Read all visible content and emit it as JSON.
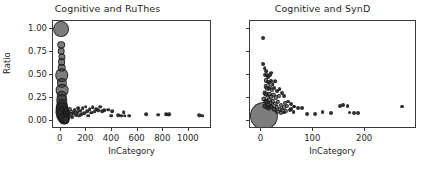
{
  "figure": {
    "width": 430,
    "height": 173,
    "background": "#ffffff",
    "marker_color": "#2d2d2d",
    "axis_color": "#3a3a3a",
    "text_color": "#262626"
  },
  "shared": {
    "ylabel": "Ratio",
    "xlabel": "InCategory"
  },
  "chart_data": [
    {
      "type": "scatter",
      "title": "Cognitive and RuThes",
      "xlabel": "InCategory",
      "ylabel": "Ratio",
      "xlim": [
        -60,
        1180
      ],
      "ylim": [
        -0.09,
        1.09
      ],
      "xticks": [
        0,
        200,
        400,
        600,
        800,
        1000
      ],
      "xticklabels": [
        "0",
        "200",
        "400",
        "600",
        "800",
        "1000"
      ],
      "yticks": [
        0.0,
        0.25,
        0.5,
        0.75,
        1.0
      ],
      "yticklabels": [
        "0.00",
        "0.25",
        "0.50",
        "0.75",
        "1.00"
      ],
      "grid": false,
      "legend": null,
      "marker_size_encodes": "count",
      "points": [
        {
          "x": 6,
          "y": 1.0,
          "s": 150
        },
        {
          "x": 6,
          "y": 0.83,
          "s": 34
        },
        {
          "x": 6,
          "y": 0.76,
          "s": 26
        },
        {
          "x": 7,
          "y": 0.7,
          "s": 30
        },
        {
          "x": 7,
          "y": 0.64,
          "s": 36
        },
        {
          "x": 7,
          "y": 0.58,
          "s": 44
        },
        {
          "x": 8,
          "y": 0.5,
          "s": 108
        },
        {
          "x": 8,
          "y": 0.41,
          "s": 62
        },
        {
          "x": 9,
          "y": 0.335,
          "s": 96
        },
        {
          "x": 9,
          "y": 0.27,
          "s": 66
        },
        {
          "x": 10,
          "y": 0.225,
          "s": 78
        },
        {
          "x": 11,
          "y": 0.185,
          "s": 70
        },
        {
          "x": 12,
          "y": 0.155,
          "s": 86
        },
        {
          "x": 13,
          "y": 0.125,
          "s": 96
        },
        {
          "x": 14,
          "y": 0.1,
          "s": 104
        },
        {
          "x": 16,
          "y": 0.075,
          "s": 110
        },
        {
          "x": 18,
          "y": 0.055,
          "s": 104
        },
        {
          "x": 22,
          "y": 0.035,
          "s": 88
        },
        {
          "x": 26,
          "y": 0.02,
          "s": 70
        },
        {
          "x": 32,
          "y": 0.01,
          "s": 52
        },
        {
          "x": 38,
          "y": 0.005,
          "s": 36
        },
        {
          "x": 30,
          "y": 0.105,
          "s": 20
        },
        {
          "x": 36,
          "y": 0.085,
          "s": 16
        },
        {
          "x": 44,
          "y": 0.115,
          "s": 14
        },
        {
          "x": 48,
          "y": 0.065,
          "s": 12
        },
        {
          "x": 56,
          "y": 0.09,
          "s": 12
        },
        {
          "x": 62,
          "y": 0.05,
          "s": 11
        },
        {
          "x": 70,
          "y": 0.13,
          "s": 10
        },
        {
          "x": 76,
          "y": 0.07,
          "s": 10
        },
        {
          "x": 84,
          "y": 0.1,
          "s": 10
        },
        {
          "x": 92,
          "y": 0.045,
          "s": 9
        },
        {
          "x": 100,
          "y": 0.085,
          "s": 9
        },
        {
          "x": 108,
          "y": 0.12,
          "s": 9
        },
        {
          "x": 118,
          "y": 0.06,
          "s": 9
        },
        {
          "x": 126,
          "y": 0.095,
          "s": 8
        },
        {
          "x": 134,
          "y": 0.14,
          "s": 8
        },
        {
          "x": 142,
          "y": 0.055,
          "s": 8
        },
        {
          "x": 152,
          "y": 0.11,
          "s": 8
        },
        {
          "x": 160,
          "y": 0.075,
          "s": 8
        },
        {
          "x": 172,
          "y": 0.135,
          "s": 8
        },
        {
          "x": 184,
          "y": 0.085,
          "s": 8
        },
        {
          "x": 196,
          "y": 0.155,
          "s": 8
        },
        {
          "x": 205,
          "y": 0.105,
          "s": 8
        },
        {
          "x": 214,
          "y": 0.055,
          "s": 8
        },
        {
          "x": 226,
          "y": 0.125,
          "s": 8
        },
        {
          "x": 238,
          "y": 0.09,
          "s": 8
        },
        {
          "x": 250,
          "y": 0.145,
          "s": 8
        },
        {
          "x": 262,
          "y": 0.1,
          "s": 8
        },
        {
          "x": 276,
          "y": 0.13,
          "s": 8
        },
        {
          "x": 292,
          "y": 0.115,
          "s": 8
        },
        {
          "x": 308,
          "y": 0.155,
          "s": 8
        },
        {
          "x": 322,
          "y": 0.105,
          "s": 8
        },
        {
          "x": 340,
          "y": 0.115,
          "s": 8
        },
        {
          "x": 368,
          "y": 0.12,
          "s": 8
        },
        {
          "x": 392,
          "y": 0.055,
          "s": 8
        },
        {
          "x": 404,
          "y": 0.105,
          "s": 8
        },
        {
          "x": 448,
          "y": 0.06,
          "s": 8
        },
        {
          "x": 470,
          "y": 0.055,
          "s": 8
        },
        {
          "x": 492,
          "y": 0.095,
          "s": 8
        },
        {
          "x": 500,
          "y": 0.055,
          "s": 8
        },
        {
          "x": 534,
          "y": 0.055,
          "s": 8
        },
        {
          "x": 668,
          "y": 0.075,
          "s": 8
        },
        {
          "x": 762,
          "y": 0.065,
          "s": 8
        },
        {
          "x": 820,
          "y": 0.075,
          "s": 8
        },
        {
          "x": 836,
          "y": 0.065,
          "s": 8
        },
        {
          "x": 848,
          "y": 0.075,
          "s": 8
        },
        {
          "x": 1082,
          "y": 0.06,
          "s": 8
        },
        {
          "x": 1102,
          "y": 0.055,
          "s": 8
        }
      ]
    },
    {
      "type": "scatter",
      "title": "Cognitive and SynD",
      "xlabel": "InCategory",
      "ylabel": "Ratio",
      "xlim": [
        -22,
        300
      ],
      "ylim": [
        -0.09,
        1.09
      ],
      "xticks": [
        0,
        100,
        200
      ],
      "xticklabels": [
        "0",
        "100",
        "200"
      ],
      "yticks": [
        0.0,
        0.25,
        0.5,
        0.75,
        1.0
      ],
      "yticklabels": [],
      "grid": false,
      "legend": null,
      "marker_size_encodes": "count",
      "points": [
        {
          "x": 5,
          "y": 0.05,
          "s": 470
        },
        {
          "x": 3,
          "y": 0.9,
          "s": 9
        },
        {
          "x": 4,
          "y": 0.62,
          "s": 9
        },
        {
          "x": 6,
          "y": 0.575,
          "s": 8
        },
        {
          "x": 9,
          "y": 0.545,
          "s": 8
        },
        {
          "x": 7,
          "y": 0.5,
          "s": 9
        },
        {
          "x": 11,
          "y": 0.495,
          "s": 8
        },
        {
          "x": 13,
          "y": 0.475,
          "s": 9
        },
        {
          "x": 16,
          "y": 0.5,
          "s": 9
        },
        {
          "x": 19,
          "y": 0.525,
          "s": 8
        },
        {
          "x": 9,
          "y": 0.44,
          "s": 10
        },
        {
          "x": 12,
          "y": 0.425,
          "s": 11
        },
        {
          "x": 15,
          "y": 0.41,
          "s": 9
        },
        {
          "x": 18,
          "y": 0.435,
          "s": 9
        },
        {
          "x": 22,
          "y": 0.4,
          "s": 8
        },
        {
          "x": 26,
          "y": 0.43,
          "s": 8
        },
        {
          "x": 8,
          "y": 0.375,
          "s": 12
        },
        {
          "x": 11,
          "y": 0.355,
          "s": 12
        },
        {
          "x": 14,
          "y": 0.345,
          "s": 11
        },
        {
          "x": 17,
          "y": 0.365,
          "s": 10
        },
        {
          "x": 21,
          "y": 0.335,
          "s": 10
        },
        {
          "x": 25,
          "y": 0.355,
          "s": 9
        },
        {
          "x": 30,
          "y": 0.325,
          "s": 9
        },
        {
          "x": 35,
          "y": 0.345,
          "s": 9
        },
        {
          "x": 6,
          "y": 0.305,
          "s": 14
        },
        {
          "x": 9,
          "y": 0.29,
          "s": 14
        },
        {
          "x": 12,
          "y": 0.275,
          "s": 13
        },
        {
          "x": 15,
          "y": 0.295,
          "s": 12
        },
        {
          "x": 19,
          "y": 0.265,
          "s": 12
        },
        {
          "x": 23,
          "y": 0.285,
          "s": 11
        },
        {
          "x": 28,
          "y": 0.255,
          "s": 10
        },
        {
          "x": 33,
          "y": 0.275,
          "s": 10
        },
        {
          "x": 39,
          "y": 0.3,
          "s": 9
        },
        {
          "x": 44,
          "y": 0.27,
          "s": 9
        },
        {
          "x": 5,
          "y": 0.235,
          "s": 16
        },
        {
          "x": 8,
          "y": 0.22,
          "s": 16
        },
        {
          "x": 11,
          "y": 0.205,
          "s": 15
        },
        {
          "x": 14,
          "y": 0.225,
          "s": 14
        },
        {
          "x": 18,
          "y": 0.195,
          "s": 13
        },
        {
          "x": 22,
          "y": 0.215,
          "s": 12
        },
        {
          "x": 27,
          "y": 0.185,
          "s": 11
        },
        {
          "x": 32,
          "y": 0.205,
          "s": 11
        },
        {
          "x": 38,
          "y": 0.175,
          "s": 10
        },
        {
          "x": 45,
          "y": 0.195,
          "s": 10
        },
        {
          "x": 52,
          "y": 0.21,
          "s": 9
        },
        {
          "x": 58,
          "y": 0.185,
          "s": 9
        },
        {
          "x": 6,
          "y": 0.165,
          "s": 16
        },
        {
          "x": 10,
          "y": 0.15,
          "s": 16
        },
        {
          "x": 14,
          "y": 0.14,
          "s": 15
        },
        {
          "x": 19,
          "y": 0.155,
          "s": 14
        },
        {
          "x": 24,
          "y": 0.13,
          "s": 13
        },
        {
          "x": 30,
          "y": 0.145,
          "s": 12
        },
        {
          "x": 36,
          "y": 0.125,
          "s": 11
        },
        {
          "x": 43,
          "y": 0.145,
          "s": 10
        },
        {
          "x": 50,
          "y": 0.16,
          "s": 10
        },
        {
          "x": 57,
          "y": 0.13,
          "s": 9
        },
        {
          "x": 64,
          "y": 0.155,
          "s": 9
        },
        {
          "x": 40,
          "y": 0.115,
          "s": 10
        },
        {
          "x": 48,
          "y": 0.105,
          "s": 10
        },
        {
          "x": 55,
          "y": 0.12,
          "s": 9
        },
        {
          "x": 62,
          "y": 0.1,
          "s": 9
        },
        {
          "x": 70,
          "y": 0.135,
          "s": 9
        },
        {
          "x": 31,
          "y": 0.095,
          "s": 11
        },
        {
          "x": 37,
          "y": 0.085,
          "s": 10
        },
        {
          "x": 44,
          "y": 0.09,
          "s": 9
        },
        {
          "x": 62,
          "y": 0.155,
          "s": 9
        },
        {
          "x": 78,
          "y": 0.14,
          "s": 9
        },
        {
          "x": 88,
          "y": 0.075,
          "s": 9
        },
        {
          "x": 103,
          "y": 0.075,
          "s": 9
        },
        {
          "x": 118,
          "y": 0.095,
          "s": 9
        },
        {
          "x": 134,
          "y": 0.08,
          "s": 9
        },
        {
          "x": 152,
          "y": 0.165,
          "s": 9
        },
        {
          "x": 158,
          "y": 0.17,
          "s": 9
        },
        {
          "x": 166,
          "y": 0.165,
          "s": 9
        },
        {
          "x": 170,
          "y": 0.09,
          "s": 9
        },
        {
          "x": 178,
          "y": 0.08,
          "s": 9
        },
        {
          "x": 186,
          "y": 0.085,
          "s": 9
        },
        {
          "x": 272,
          "y": 0.155,
          "s": 9
        }
      ]
    }
  ]
}
